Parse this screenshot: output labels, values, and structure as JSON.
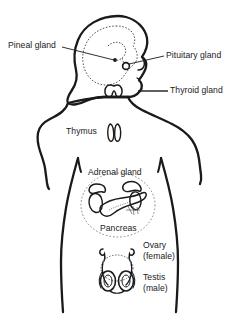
{
  "figure": {
    "background_color": "#ffffff",
    "line_color": "#1a1a1a",
    "dotted_color": "#555555"
  },
  "labels": {
    "pineal": "Pineal gland",
    "pituitary": "Pituitary gland",
    "thyroid": "Thyroid gland",
    "thymus": "Thymus",
    "adrenal": "Adrenal gland",
    "pancreas": "Pancreas",
    "ovary": "Ovary",
    "ovary_sub": "(female)",
    "testis": "Testis",
    "testis_sub": "(male)"
  },
  "organs": [
    {
      "name": "pineal-gland",
      "label": "Pineal gland"
    },
    {
      "name": "pituitary-gland",
      "label": "Pituitary gland"
    },
    {
      "name": "thyroid-gland",
      "label": "Thyroid gland"
    },
    {
      "name": "thymus-gland",
      "label": "Thymus"
    },
    {
      "name": "adrenal-gland",
      "label": "Adrenal gland"
    },
    {
      "name": "pancreas",
      "label": "Pancreas"
    },
    {
      "name": "ovary",
      "label": "Ovary (female)"
    },
    {
      "name": "testis",
      "label": "Testis (male)"
    }
  ]
}
